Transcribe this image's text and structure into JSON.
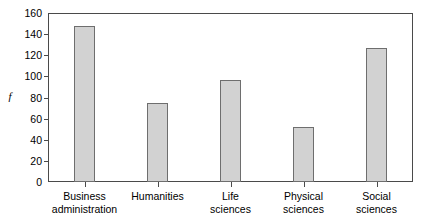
{
  "chart_data": {
    "type": "bar",
    "title": "",
    "subtitle": "",
    "xlabel": "",
    "ylabel": "f",
    "ylim": [
      0,
      160
    ],
    "ytick_step": 20,
    "yticks": [
      0,
      20,
      40,
      60,
      80,
      100,
      120,
      140,
      160
    ],
    "grid": false,
    "legend": false,
    "categories": [
      "Business administration",
      "Humanities",
      "Life sciences",
      "Physical sciences",
      "Social sciences"
    ],
    "category_lines": [
      [
        "Business",
        "administration"
      ],
      [
        "Humanities",
        ""
      ],
      [
        "Life",
        "sciences"
      ],
      [
        "Physical",
        "sciences"
      ],
      [
        "Social",
        "sciences"
      ]
    ],
    "values": [
      148,
      75,
      97,
      52,
      127
    ],
    "bar_color": "#d2d2d2",
    "bar_border_color": "#6e6e6e",
    "axis_color": "#4a4a4a"
  }
}
